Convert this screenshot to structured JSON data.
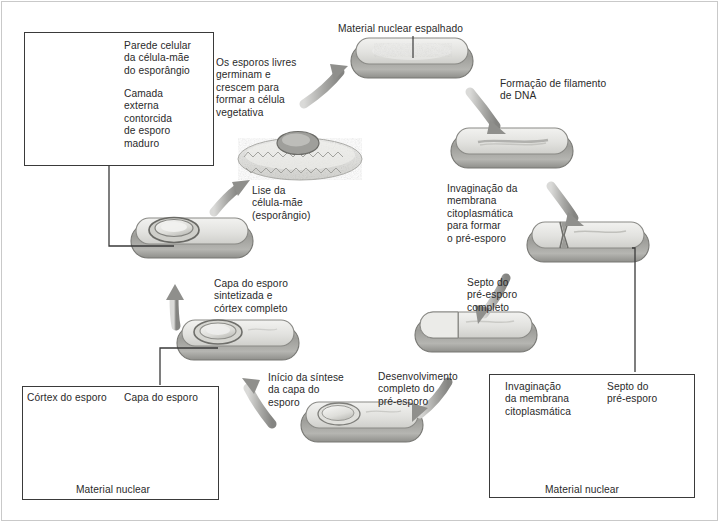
{
  "figure": {
    "title_text": "Bacterial endospore formation cycle (Portuguese labels)",
    "language": "pt-BR",
    "colors": {
      "text": "#2a2a2a",
      "frame": "#3a3a3a",
      "cell_wall": "#8c8c8c",
      "cell_fill": "#e8e8e6",
      "arrow": "#9a9a9a",
      "outer_border": "#c9c9c9"
    }
  },
  "insets": {
    "top_left": {
      "name": "mature-spore-micrograph",
      "labels": [
        {
          "id": "parede",
          "text": "Parede celular\nda célula-mãe\ndo esporângio"
        },
        {
          "id": "camada",
          "text": "Camada\nexterna\ncontorcida\nde esporo\nmaduro"
        }
      ]
    },
    "bottom_left": {
      "name": "spore-cortex-micrograph",
      "labels": [
        {
          "id": "cortex",
          "text": "Córtex do esporo"
        },
        {
          "id": "capa",
          "text": "Capa do esporo"
        },
        {
          "id": "material",
          "text": "Material nuclear"
        }
      ]
    },
    "bottom_right": {
      "name": "prespore-septum-micrograph",
      "labels": [
        {
          "id": "invag",
          "text": "Invaginação\nda membrana\ncitoplasmática"
        },
        {
          "id": "septo",
          "text": "Septo do\npré-esporo"
        },
        {
          "id": "material",
          "text": "Material nuclear"
        }
      ]
    }
  },
  "stages": [
    {
      "id": "vegetative",
      "label": "Material nuclear espalhado",
      "caption_position": "above"
    },
    {
      "id": "dna-filament",
      "label": "Formação de filamento\nde DNA",
      "caption_position": "left"
    },
    {
      "id": "invagination",
      "label": "Invaginação da\nmembrana\ncitoplasmática\npara formar\no pré-esporo",
      "caption_position": "left"
    },
    {
      "id": "septum-complete",
      "label": "Septo do\npré-esporo\ncompleto",
      "caption_position": "left"
    },
    {
      "id": "prespore-developed",
      "label": "Desenvolvimento\ncompleto do\npré-esporo",
      "caption_position": "left"
    },
    {
      "id": "coat-synthesis-start",
      "label": "Início da síntese\nda capa do\nesporo",
      "caption_position": "right"
    },
    {
      "id": "coat-cortex-complete",
      "label": "Capa do esporo\nsintetizada e\ncórtex completo",
      "caption_position": "right"
    },
    {
      "id": "mother-cell-lysis",
      "label": "Lise da\ncélula-mãe\n(esporângio)",
      "caption_position": "below"
    },
    {
      "id": "germination",
      "label": "Os esporos livres\ngerminam e\ncrescem para\nformar a célula\nvegetativa",
      "caption_position": "left"
    }
  ]
}
